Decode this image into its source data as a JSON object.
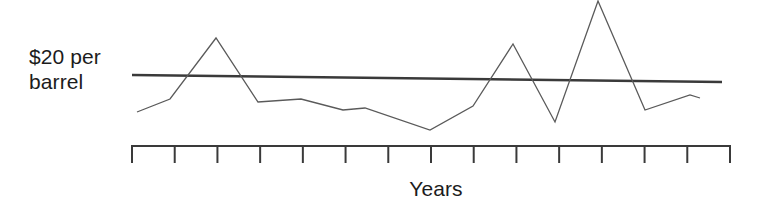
{
  "chart_data": {
    "type": "line",
    "title": "",
    "subtitle": "",
    "xlabel": "Years",
    "ylabel": "$20 per\nbarrel",
    "ylabel_line1": "$20 per",
    "ylabel_line2": "barrel",
    "grid": false,
    "legend": "none",
    "axis_style": "x-axis-only-with-ticks",
    "tick_count": 15,
    "x_tick_labels": [
      "",
      "",
      "",
      "",
      "",
      "",
      "",
      "",
      "",
      "",
      "",
      "",
      "",
      "",
      ""
    ],
    "x": [
      1,
      2,
      3,
      4,
      5,
      6,
      7,
      8,
      9,
      10,
      11,
      12,
      13,
      14,
      15
    ],
    "xlim": [
      1,
      15
    ],
    "ylim": [
      10.5,
      31.5
    ],
    "reference_line": {
      "label": "$20 per barrel",
      "value": 20,
      "color": "#3a3a3a",
      "width_px": 2.6,
      "x_start_px": 132,
      "x_end_px": 722,
      "y_start_px": 75,
      "y_end_px": 82
    },
    "series": [
      {
        "name": "Oil price",
        "color": "#5a5a5a",
        "width_px": 1.3,
        "values": [
          14.9,
          16.7,
          25.5,
          16.3,
          16.7,
          15.2,
          15.5,
          12.4,
          15.9,
          24.8,
          13.8,
          31.2,
          15.2,
          17.5,
          17.1
        ],
        "points_px": [
          [
            137,
            112
          ],
          [
            170,
            99
          ],
          [
            216,
            38
          ],
          [
            258,
            102
          ],
          [
            301,
            99
          ],
          [
            343,
            110
          ],
          [
            365,
            108
          ],
          [
            430,
            130
          ],
          [
            473,
            106
          ],
          [
            513,
            44
          ],
          [
            555,
            122
          ],
          [
            598,
            1
          ],
          [
            645,
            110
          ],
          [
            690,
            95
          ],
          [
            700,
            98
          ]
        ]
      }
    ],
    "axis_px": {
      "baseline_y": 146,
      "x_start": 132,
      "x_end": 730,
      "tick_length": 17,
      "tick_spacing": 42.7
    },
    "colors": {
      "background": "#ffffff",
      "axis": "#3a3a3a",
      "data_line": "#5a5a5a",
      "reference_line": "#3a3a3a",
      "text": "#1c1c1c"
    }
  }
}
